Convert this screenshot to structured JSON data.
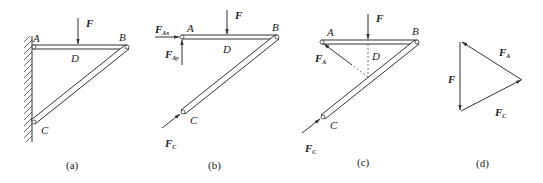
{
  "figure": {
    "panels": [
      {
        "id": "a",
        "caption": "(a)",
        "points": {
          "A": "A",
          "B": "B",
          "C": "C",
          "D": "D"
        },
        "forces": {
          "F": "F"
        }
      },
      {
        "id": "b",
        "caption": "(b)",
        "points": {
          "A": "A",
          "B": "B",
          "C": "C",
          "D": "D"
        },
        "forces": {
          "F": "F",
          "F_Ax": {
            "main": "F",
            "sub": "Ax"
          },
          "F_Ay": {
            "main": "F",
            "sub": "Ay"
          },
          "F_C": {
            "main": "F",
            "sub": "C"
          }
        }
      },
      {
        "id": "c",
        "caption": "(c)",
        "points": {
          "A": "A",
          "B": "B",
          "C": "C",
          "D": "D"
        },
        "forces": {
          "F": "F",
          "F_A": {
            "main": "F",
            "sub": "A"
          },
          "F_C": {
            "main": "F",
            "sub": "C"
          }
        }
      },
      {
        "id": "d",
        "caption": "(d)",
        "forces": {
          "F": "F",
          "F_A": {
            "main": "F",
            "sub": "A"
          },
          "F_C": {
            "main": "F",
            "sub": "C"
          }
        }
      }
    ]
  }
}
